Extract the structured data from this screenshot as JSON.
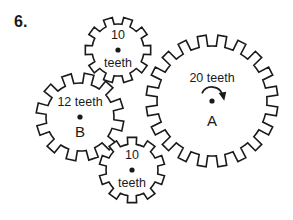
{
  "problem": {
    "number_label": "6."
  },
  "figure": {
    "type": "gear-train-diagram",
    "width": 293,
    "height": 220,
    "background_color": "#ffffff",
    "line_color": "#1a1a1a",
    "gears": [
      {
        "id": "gear-top",
        "name": "top-gear",
        "teeth": 10,
        "teeth_count_label": "10",
        "teeth_word_label": "teeth",
        "name_label": "",
        "cx": 118,
        "cy": 50,
        "outer_radius": 33,
        "root_radius": 26,
        "tooth_width_ratio": 0.52,
        "phase_deg": 0,
        "label_count_dy": -14,
        "label_word_dy": 14,
        "label_name_dy": 0,
        "has_rotation_arrow": false
      },
      {
        "id": "gear-b",
        "name": "gear-b",
        "teeth": 12,
        "teeth_count_label": "12 teeth",
        "teeth_word_label": "",
        "name_label": "B",
        "cx": 80,
        "cy": 117,
        "outer_radius": 44,
        "root_radius": 34,
        "tooth_width_ratio": 0.5,
        "phase_deg": 12,
        "label_count_dy": -14,
        "label_word_dy": 0,
        "label_name_dy": 16,
        "has_rotation_arrow": false
      },
      {
        "id": "gear-bottom",
        "name": "bottom-gear",
        "teeth": 10,
        "teeth_count_label": "10",
        "teeth_word_label": "teeth",
        "name_label": "",
        "cx": 132,
        "cy": 170,
        "outer_radius": 33,
        "root_radius": 26,
        "tooth_width_ratio": 0.52,
        "phase_deg": 18,
        "label_count_dy": -14,
        "label_word_dy": 14,
        "label_name_dy": 0,
        "has_rotation_arrow": false
      },
      {
        "id": "gear-a",
        "name": "gear-a",
        "teeth": 20,
        "teeth_count_label": "20 teeth",
        "teeth_word_label": "",
        "name_label": "A",
        "cx": 212,
        "cy": 101,
        "outer_radius": 66,
        "root_radius": 55,
        "tooth_width_ratio": 0.5,
        "phase_deg": 9,
        "label_count_dy": -22,
        "label_word_dy": 0,
        "label_name_dy": 21,
        "has_rotation_arrow": true,
        "rotation_direction": "clockwise",
        "arrow_radius": 11,
        "arrow_start_deg": 205,
        "arrow_end_deg": 345
      }
    ]
  }
}
